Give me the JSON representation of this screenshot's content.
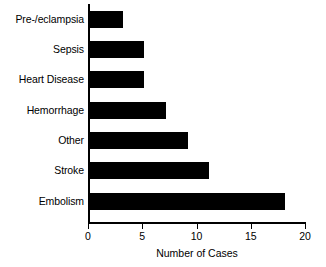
{
  "chart_data": {
    "type": "bar",
    "orientation": "horizontal",
    "title": "",
    "xlabel": "Number of Cases",
    "ylabel": "",
    "categories": [
      "Pre-/eclampsia",
      "Sepsis",
      "Heart Disease",
      "Hemorrhage",
      "Other",
      "Stroke",
      "Embolism"
    ],
    "values": [
      3,
      5,
      5,
      7,
      9,
      11,
      18
    ],
    "xlim": [
      0,
      20
    ],
    "xticks": [
      0,
      5,
      10,
      15,
      20
    ],
    "xtick_labels": [
      "0",
      "5",
      "10",
      "15",
      "20"
    ],
    "grid": false,
    "legend": false,
    "bar_color": "#000000",
    "axis_color": "#000000",
    "background_color": "#ffffff"
  }
}
